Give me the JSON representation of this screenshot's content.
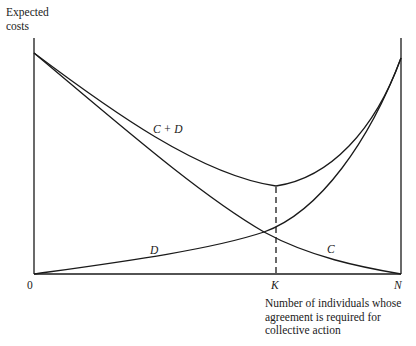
{
  "diagram": {
    "y_axis_label_line1": "Expected",
    "y_axis_label_line2": "costs",
    "x_axis_label": "Number of  individuals whose\nagreement is required for\ncollective action",
    "origin_label": "0",
    "k_label": "K",
    "n_label": "N",
    "curves": [
      {
        "name": "C",
        "label": "C",
        "description": "External costs, decreasing from high at 0 to zero at N"
      },
      {
        "name": "D",
        "label": "D",
        "description": "Decision-making costs, increasing from zero at 0 to high at N"
      },
      {
        "name": "C+D",
        "label": "C + D",
        "description": "Total expected costs, U-shaped with minimum at K"
      }
    ],
    "optimum_marker": "dashed vertical line at K from minimum of C + D to the x-axis",
    "line_color": "#1a1a1a",
    "background_color": "#ffffff"
  }
}
